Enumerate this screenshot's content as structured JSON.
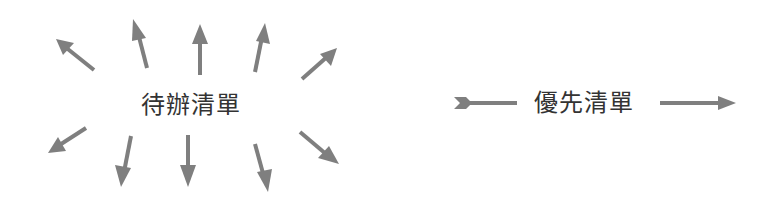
{
  "diagram": {
    "left": {
      "label": "待辦清單",
      "description": "scattered arrows radiating outward"
    },
    "right": {
      "label": "優先清單",
      "description": "single arrow passing straight through"
    },
    "colors": {
      "arrow": "#7f7f7f",
      "text": "#333333",
      "background": "#ffffff"
    }
  }
}
